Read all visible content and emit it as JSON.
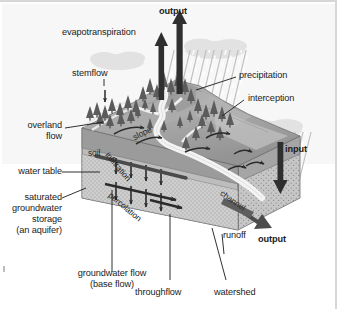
{
  "figure": {
    "type": "diagram",
    "background": "#ffffff",
    "border_color": "#d7d7d7"
  },
  "palette": {
    "sky": "#f2f2f2",
    "cloud": "#dcdcdc",
    "rain": "#c9c9c9",
    "hill_light": "#b9b9b9",
    "hill_mid": "#a3a3a3",
    "hill_dark": "#8c8c8c",
    "soil_face": "#9d9d9d",
    "aquifer_face": "#cfcfcf",
    "block_front": "#b3b3b3",
    "block_top": "#a8a8a8",
    "river": "#efefef",
    "tree": "#5d5d5d",
    "arrow": "#2b2b2b",
    "leader": "#1b1b1b",
    "text": "#1b1b1b"
  },
  "labels": {
    "output_top": "output",
    "evapotranspiration": "evapotranspiration",
    "stemflow": "stemflow",
    "precipitation": "precipitation",
    "interception": "interception",
    "overland_flow_line1": "overland",
    "overland_flow_line2": "flow",
    "soil": "soil",
    "slope": "slope",
    "infiltration": "infiltration",
    "percolation": "percolation",
    "water_table": "water table",
    "saturated_line1": "saturated",
    "saturated_line2": "groundwater",
    "saturated_line3": "storage",
    "saturated_line4": "(an aquifer)",
    "groundwater_flow_line1": "groundwater flow",
    "groundwater_flow_line2": "(base flow)",
    "throughflow": "throughflow",
    "watershed": "watershed",
    "runoff": "runoff",
    "channel": "channel",
    "input": "input",
    "output_right": "output"
  },
  "icons": {
    "up_arrow": "evapotranspiration-arrow",
    "down_arrow": "precipitation-arrow",
    "tree": "conifer-tree-icon",
    "cloud": "cloud-icon"
  }
}
